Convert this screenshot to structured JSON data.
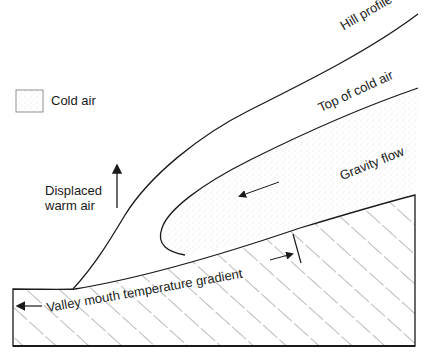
{
  "diagram": {
    "legend": {
      "swatch": "stipple-swatch",
      "label": "Cold air"
    },
    "labels": {
      "hill_profile": "Hill profile",
      "top_of_cold_air": "Top of cold air",
      "gravity_flow": "Gravity flow",
      "displaced_line1": "Displaced",
      "displaced_line2": "warm air",
      "valley_mouth": "Valley mouth temperature gradient"
    },
    "colors": {
      "line": "#1a1a1a",
      "stipple": "#c8c8c8",
      "background": "#ffffff"
    }
  }
}
